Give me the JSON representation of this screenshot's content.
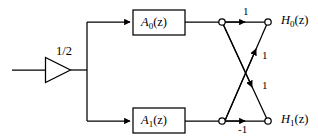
{
  "figure": {
    "type": "signal-flow-block-diagram",
    "title": "",
    "background_color": "#ffffff",
    "line_color": "#000000",
    "width": 318,
    "height": 140
  },
  "blocks": [
    {
      "id": "a0",
      "label_main": "A",
      "label_sub": "0",
      "label_arg": "(z)",
      "label_full": "A0(z)",
      "x": 133,
      "y": 10,
      "w": 52,
      "h": 25
    },
    {
      "id": "a1",
      "label_main": "A",
      "label_sub": "1",
      "label_arg": "(z)",
      "label_full": "A1(z)",
      "x": 133,
      "y": 108,
      "w": 52,
      "h": 25
    }
  ],
  "gain": {
    "id": "half-gain",
    "label": "1/2",
    "shape": "triangle-amplifier",
    "x": 45,
    "y": 58,
    "w": 25,
    "h": 24
  },
  "coefficients": [
    {
      "id": "top-direct",
      "label": "1",
      "x": 243,
      "y": 8
    },
    {
      "id": "cross-up",
      "label": "1",
      "x": 262,
      "y": 50
    },
    {
      "id": "cross-down",
      "label": "1",
      "x": 262,
      "y": 80
    },
    {
      "id": "bottom-direct",
      "label": "-1",
      "x": 240,
      "y": 124
    }
  ],
  "outputs": [
    {
      "id": "h0",
      "label_main": "H",
      "label_sub": "0",
      "label_arg": "(z)",
      "label_full": "H0(z)",
      "x": 281,
      "y": 14
    },
    {
      "id": "h1",
      "label_main": "H",
      "label_sub": "1",
      "label_arg": "(z)",
      "label_full": "H1(z)",
      "x": 281,
      "y": 113
    }
  ],
  "nodes": [
    {
      "id": "node-top-left",
      "cx": 222,
      "cy": 22,
      "r": 3.2
    },
    {
      "id": "node-top-right",
      "cx": 268,
      "cy": 22,
      "r": 3.2
    },
    {
      "id": "node-bottom-left",
      "cx": 222,
      "cy": 121,
      "r": 3.2
    },
    {
      "id": "node-bottom-right",
      "cx": 268,
      "cy": 121,
      "r": 3.2
    }
  ]
}
